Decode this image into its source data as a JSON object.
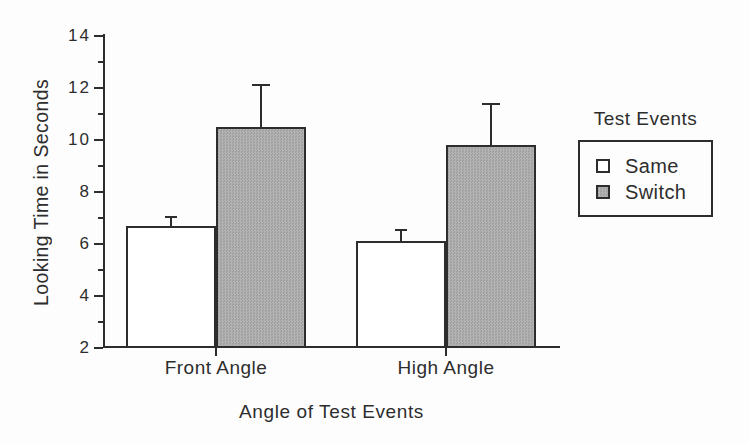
{
  "chart_data": {
    "type": "bar",
    "title": "",
    "xlabel": "Angle of Test Events",
    "ylabel": "Looking Time in Seconds",
    "categories": [
      "Front Angle",
      "High Angle"
    ],
    "series": [
      {
        "name": "Same",
        "values": [
          6.7,
          6.1
        ],
        "errors_plus": [
          0.35,
          0.45
        ],
        "fill": "#ffffff"
      },
      {
        "name": "Switch",
        "values": [
          10.5,
          9.8
        ],
        "errors_plus": [
          1.6,
          1.6
        ],
        "fill": "#a9a9a9"
      }
    ],
    "ylim": [
      2,
      14
    ],
    "yticks": [
      2,
      4,
      6,
      8,
      10,
      12,
      14
    ],
    "minor_tick_step": 1,
    "grid": false,
    "error_bars": "upper_only",
    "legend": {
      "title": "Test Events",
      "position": "right-middle",
      "entries": [
        "Same",
        "Switch"
      ]
    }
  },
  "colors": {
    "text": "#2d2d2d",
    "axis": "#2d2d2d",
    "bar_border": "#2d2d2d",
    "same_fill": "#ffffff",
    "switch_fill": "#a9a9a9",
    "background": "#fdfdfd"
  }
}
